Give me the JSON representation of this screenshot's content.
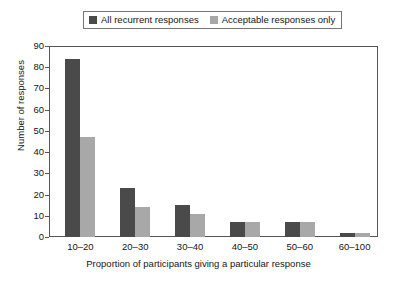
{
  "chart_data": {
    "type": "bar",
    "title": "",
    "subtitle": "",
    "xlabel": "Proportion of participants giving a particular response",
    "ylabel": "Number of responses",
    "categories": [
      "10–20",
      "20–30",
      "30–40",
      "40–50",
      "50–60",
      "60–100"
    ],
    "series": [
      {
        "name": "All recurrent responses",
        "values": [
          84,
          23,
          15,
          7,
          7,
          2
        ],
        "color": "#4a4a4a"
      },
      {
        "name": "Acceptable responses only",
        "values": [
          47,
          14,
          11,
          7,
          7,
          2
        ],
        "color": "#a8a8a8"
      }
    ],
    "ylim": [
      0,
      90
    ],
    "yticks": [
      0,
      10,
      20,
      30,
      40,
      50,
      60,
      70,
      80,
      90
    ],
    "ytick_labels": [
      "0",
      "10",
      "20",
      "30",
      "40",
      "50",
      "60",
      "70",
      "80",
      "90"
    ],
    "grid": false,
    "legend_position": "top-center",
    "frame": true
  },
  "legend": {
    "entries": [
      {
        "label": "All recurrent responses",
        "swatch": "dark"
      },
      {
        "label": "Acceptable responses only",
        "swatch": "light"
      }
    ]
  },
  "colors": {
    "series_dark": "#4a4a4a",
    "series_light": "#a8a8a8",
    "axis": "#555555",
    "text": "#161616",
    "background": "#ffffff"
  }
}
